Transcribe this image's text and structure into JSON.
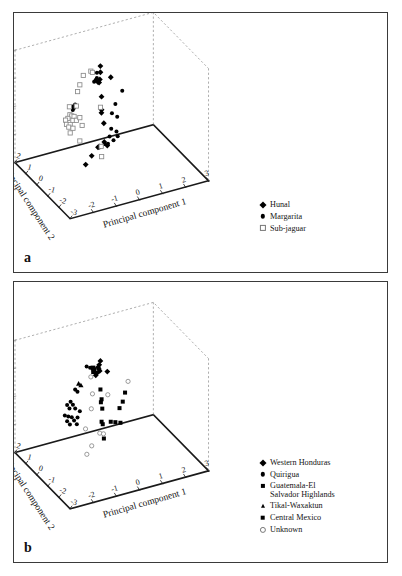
{
  "figure": {
    "background": "#ffffff",
    "frame_color": "#3a3a3a"
  },
  "panels": [
    {
      "id": "a",
      "letter": "a",
      "legend": [
        {
          "label": "Hunal",
          "marker": "diamond"
        },
        {
          "label": "Margarita",
          "marker": "circle"
        },
        {
          "label": "Sub-jaguar",
          "marker": "open-square"
        }
      ]
    },
    {
      "id": "b",
      "letter": "b",
      "legend": [
        {
          "label": "Western Honduras",
          "marker": "diamond"
        },
        {
          "label": "Quirigua",
          "marker": "circle"
        },
        {
          "label": "Guatemala-El Salvador Highlands",
          "marker": "square-sm"
        },
        {
          "label": "Tikal-Waxaktun",
          "marker": "triangle"
        },
        {
          "label": "Central Mexico",
          "marker": "square"
        },
        {
          "label": "Unknown",
          "marker": "open-circle"
        }
      ]
    }
  ],
  "chart_data": [
    {
      "type": "scatter",
      "panel": "a",
      "title": "",
      "projection": "3d",
      "xlabel": "Principal component 1",
      "ylabel": "Principal component 2",
      "zlabel": "Principal component 3",
      "xlim": [
        -3,
        3
      ],
      "ylim": [
        -3,
        2
      ],
      "zlim": [
        -2,
        2
      ],
      "xticks": [
        -2,
        -1,
        0,
        1,
        2,
        3
      ],
      "yticks": [
        2,
        1,
        0,
        -1,
        -2,
        -3
      ],
      "zticks": [
        -2,
        -1,
        0,
        1,
        2
      ],
      "grid": false,
      "legend_position": "right",
      "series": [
        {
          "name": "Hunal",
          "marker": "diamond",
          "color": "#000000",
          "points": [
            [
              -0.35,
              -0.2,
              1.72
            ],
            [
              -0.3,
              -0.1,
              1.45
            ],
            [
              -0.42,
              -0.3,
              1.3
            ],
            [
              -0.48,
              -0.25,
              1.2
            ],
            [
              -0.38,
              -0.15,
              1.12
            ],
            [
              0.1,
              -0.2,
              1.22
            ],
            [
              -0.3,
              -0.2,
              0.62
            ],
            [
              -0.25,
              -0.1,
              0.1
            ],
            [
              -0.28,
              -0.15,
              0.02
            ],
            [
              -0.2,
              -0.2,
              -0.35
            ],
            [
              -0.55,
              -0.4,
              -1.05
            ],
            [
              -0.45,
              -0.3,
              -1.08
            ],
            [
              -0.18,
              -0.2,
              -1.02
            ],
            [
              -0.05,
              -0.2,
              -1.18
            ],
            [
              -0.7,
              0.4,
              -1.95
            ],
            [
              -0.2,
              0.9,
              -1.95
            ]
          ]
        },
        {
          "name": "Margarita",
          "marker": "circle",
          "color": "#000000",
          "points": [
            [
              -0.5,
              -0.2,
              1.52
            ],
            [
              -0.55,
              -0.3,
              1.38
            ],
            [
              -0.58,
              -0.25,
              1.3
            ],
            [
              -0.62,
              -0.2,
              1.22
            ],
            [
              -1.35,
              0.0,
              0.5
            ],
            [
              -1.42,
              0.1,
              0.4
            ],
            [
              -1.38,
              0.05,
              0.36
            ],
            [
              -1.45,
              0.0,
              0.32
            ],
            [
              0.55,
              -0.3,
              0.68
            ],
            [
              0.3,
              -0.2,
              0.22
            ],
            [
              0.2,
              -0.1,
              -0.12
            ],
            [
              0.38,
              -0.2,
              -0.25
            ],
            [
              0.12,
              -0.2,
              -0.62
            ],
            [
              0.3,
              -0.3,
              -0.72
            ],
            [
              0.05,
              -0.2,
              -0.88
            ],
            [
              0.4,
              -0.2,
              -0.95
            ],
            [
              0.22,
              -0.2,
              -1.05
            ],
            [
              -0.02,
              -0.2,
              -1.12
            ],
            [
              -0.12,
              -0.1,
              -1.15
            ],
            [
              -0.35,
              -0.1,
              -1.22
            ]
          ]
        },
        {
          "name": "Sub-jaguar",
          "marker": "open-square",
          "color": "#8a8a8a",
          "points": [
            [
              -0.9,
              0.2,
              1.35
            ],
            [
              -0.62,
              0.1,
              1.48
            ],
            [
              -0.55,
              0.1,
              1.42
            ],
            [
              -1.05,
              0.2,
              1.05
            ],
            [
              -1.1,
              0.3,
              0.78
            ],
            [
              -1.55,
              0.1,
              0.42
            ],
            [
              -1.25,
              0.1,
              0.38
            ],
            [
              -1.48,
              0.2,
              0.08
            ],
            [
              -1.4,
              0.2,
              0.02
            ],
            [
              -1.3,
              0.2,
              -0.02
            ],
            [
              -1.52,
              0.3,
              -0.08
            ],
            [
              -1.62,
              0.3,
              -0.12
            ],
            [
              -1.35,
              0.2,
              -0.15
            ],
            [
              -1.2,
              0.2,
              -0.18
            ],
            [
              -1.05,
              0.2,
              -0.12
            ],
            [
              -1.58,
              0.3,
              -0.28
            ],
            [
              -1.42,
              0.3,
              -0.32
            ],
            [
              -1.48,
              0.3,
              -0.4
            ],
            [
              -1.3,
              0.3,
              -0.48
            ],
            [
              -0.95,
              0.2,
              -0.42
            ],
            [
              -1.42,
              0.3,
              -0.62
            ],
            [
              -1.05,
              0.2,
              -0.95
            ],
            [
              -0.25,
              0.0,
              0.15
            ],
            [
              -0.22,
              0.0,
              -1.25
            ],
            [
              -0.2,
              0.0,
              -1.62
            ]
          ]
        }
      ]
    },
    {
      "type": "scatter",
      "panel": "b",
      "title": "",
      "projection": "3d",
      "xlabel": "Principal component 1",
      "ylabel": "Principal component 2",
      "zlabel": "Principal component 3",
      "xlim": [
        -3,
        3
      ],
      "ylim": [
        -3,
        2
      ],
      "zlim": [
        -2,
        2
      ],
      "xticks": [
        -2,
        -1,
        0,
        1,
        2,
        3
      ],
      "yticks": [
        2,
        1,
        0,
        -1,
        -2,
        -3
      ],
      "zticks": [
        -2,
        -1,
        0,
        1,
        2
      ],
      "grid": false,
      "legend_position": "right",
      "series": [
        {
          "name": "Western Honduras",
          "marker": "diamond",
          "color": "#000000",
          "points": [
            [
              -0.35,
              -0.2,
              1.55
            ],
            [
              -0.4,
              -0.2,
              1.42
            ],
            [
              -0.45,
              -0.2,
              1.35
            ],
            [
              -0.42,
              -0.2,
              1.28
            ],
            [
              -0.38,
              -0.2,
              1.2
            ],
            [
              -0.05,
              -0.2,
              1.1
            ],
            [
              -0.5,
              -0.2,
              1.15
            ],
            [
              -0.55,
              -0.2,
              1.08
            ]
          ]
        },
        {
          "name": "Quirigua",
          "marker": "circle",
          "color": "#000000",
          "points": [
            [
              -0.85,
              0.0,
              1.38
            ],
            [
              -0.7,
              0.0,
              1.3
            ],
            [
              -1.3,
              0.1,
              0.62
            ],
            [
              -1.2,
              0.1,
              0.52
            ],
            [
              -1.45,
              0.2,
              0.18
            ],
            [
              -1.6,
              0.2,
              0.1
            ],
            [
              -1.35,
              0.2,
              0.05
            ],
            [
              -1.5,
              0.2,
              -0.05
            ],
            [
              -1.25,
              0.2,
              -0.1
            ],
            [
              -1.7,
              0.2,
              -0.25
            ],
            [
              -1.55,
              0.2,
              -0.32
            ],
            [
              -1.4,
              0.2,
              -0.38
            ],
            [
              -1.6,
              0.2,
              -0.48
            ],
            [
              -1.3,
              0.2,
              -0.52
            ],
            [
              -1.15,
              0.2,
              -0.45
            ],
            [
              -1.05,
              0.2,
              -0.25
            ],
            [
              -1.48,
              0.2,
              -0.62
            ],
            [
              -1.18,
              0.2,
              -0.68
            ]
          ]
        },
        {
          "name": "Guatemala-El Salvador Highlands",
          "marker": "square-sm",
          "color": "#000000",
          "points": [
            [
              -0.3,
              -0.1,
              0.48
            ],
            [
              -0.25,
              -0.1,
              0.12
            ],
            [
              -0.28,
              -0.1,
              0.02
            ],
            [
              -0.22,
              -0.1,
              -0.22
            ],
            [
              -0.25,
              -0.1,
              -0.68
            ],
            [
              -0.2,
              -0.1,
              -0.78
            ],
            [
              0.1,
              -0.2,
              -0.72
            ],
            [
              0.3,
              -0.2,
              -0.78
            ],
            [
              0.52,
              -0.2,
              -0.85
            ],
            [
              0.48,
              -0.2,
              -0.32
            ],
            [
              0.62,
              -0.2,
              -0.12
            ],
            [
              0.72,
              -0.2,
              0.18
            ],
            [
              -0.15,
              -0.1,
              -1.3
            ]
          ]
        },
        {
          "name": "Tikal-Waxaktun",
          "marker": "triangle",
          "color": "#000000",
          "points": [
            [
              -1.15,
              0.1,
              0.8
            ],
            [
              -1.05,
              0.1,
              0.72
            ]
          ]
        },
        {
          "name": "Central Mexico",
          "marker": "square",
          "color": "#000000",
          "points": [
            [
              -0.62,
              -0.1,
              1.32
            ],
            [
              -0.58,
              -0.1,
              1.25
            ],
            [
              -0.6,
              -0.1,
              1.18
            ]
          ]
        },
        {
          "name": "Unknown",
          "marker": "open-circle",
          "color": "#8a8a8a",
          "points": [
            [
              -0.62,
              0.1,
              0.92
            ],
            [
              -0.55,
              0.1,
              0.3
            ],
            [
              -0.6,
              0.1,
              -0.22
            ],
            [
              0.02,
              -0.1,
              0.22
            ],
            [
              0.85,
              -0.2,
              0.55
            ],
            [
              -0.85,
              0.1,
              -0.88
            ],
            [
              -0.28,
              0.0,
              -1.12
            ],
            [
              -0.12,
              0.0,
              -1.18
            ],
            [
              -0.2,
              0.9,
              -1.95
            ],
            [
              -0.65,
              0.4,
              -1.95
            ]
          ]
        }
      ]
    }
  ]
}
